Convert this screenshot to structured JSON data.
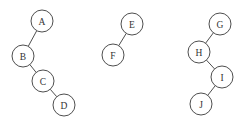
{
  "diagram": {
    "type": "binary-trees",
    "node_radius": 11,
    "colors": {
      "stroke": "#3a3a3a",
      "fill": "#ffffff",
      "label": "#333333"
    },
    "trees": [
      {
        "name": "tree-1",
        "nodes": [
          {
            "id": "A",
            "label": "A",
            "x": 42,
            "y": 21
          },
          {
            "id": "B",
            "label": "B",
            "x": 23,
            "y": 56
          },
          {
            "id": "C",
            "label": "C",
            "x": 43,
            "y": 81
          },
          {
            "id": "D",
            "label": "D",
            "x": 64,
            "y": 105
          }
        ],
        "edges": [
          {
            "from": "A",
            "to": "B"
          },
          {
            "from": "B",
            "to": "C"
          },
          {
            "from": "C",
            "to": "D"
          }
        ]
      },
      {
        "name": "tree-2",
        "nodes": [
          {
            "id": "E",
            "label": "E",
            "x": 132,
            "y": 24
          },
          {
            "id": "F",
            "label": "F",
            "x": 113,
            "y": 55
          }
        ],
        "edges": [
          {
            "from": "E",
            "to": "F"
          }
        ]
      },
      {
        "name": "tree-3",
        "nodes": [
          {
            "id": "G",
            "label": "G",
            "x": 220,
            "y": 24
          },
          {
            "id": "H",
            "label": "H",
            "x": 199,
            "y": 52
          },
          {
            "id": "I",
            "label": "I",
            "x": 222,
            "y": 77
          },
          {
            "id": "J",
            "label": "J",
            "x": 201,
            "y": 104
          }
        ],
        "edges": [
          {
            "from": "G",
            "to": "H"
          },
          {
            "from": "H",
            "to": "I"
          },
          {
            "from": "I",
            "to": "J"
          }
        ]
      }
    ]
  }
}
